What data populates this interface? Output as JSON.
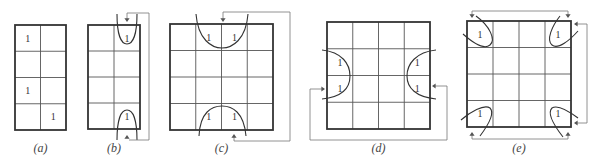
{
  "figure": {
    "width": 598,
    "height": 165,
    "cell_value": "1",
    "colors": {
      "grid": "#333333",
      "connector": "#777777",
      "text": "#333333"
    }
  },
  "maps": [
    {
      "id": "a",
      "caption": "(a)",
      "rows": 4,
      "cols": 2,
      "x": 15,
      "y": 25,
      "w": 51,
      "h": 105,
      "ones": [
        [
          0,
          0
        ],
        [
          2,
          0
        ],
        [
          3,
          1
        ]
      ],
      "loops": [],
      "connectors": []
    },
    {
      "id": "b",
      "caption": "(b)",
      "rows": 4,
      "cols": 2,
      "x": 88,
      "y": 25,
      "w": 52,
      "h": 104,
      "ones": [
        [
          0,
          1
        ],
        [
          3,
          1
        ]
      ],
      "loops": [
        "M 117 14 C 117 34, 121 44, 127 44 C 133 44, 137 34, 137 14",
        "M 117 140 C 117 120, 121 110, 127 110 C 133 110, 137 120, 137 140"
      ],
      "connectors": [
        {
          "path": "M 127 20 L 127 13 L 149 13 L 149 140 L 129 140",
          "arrows": [
            [
              127,
              22,
              "down"
            ],
            [
              127,
              135,
              "up"
            ]
          ]
        }
      ]
    },
    {
      "id": "c",
      "caption": "(c)",
      "rows": 4,
      "cols": 4,
      "x": 170,
      "y": 24,
      "w": 103,
      "h": 106,
      "ones": [
        [
          0,
          1
        ],
        [
          0,
          2
        ],
        [
          3,
          1
        ],
        [
          3,
          2
        ]
      ],
      "loops": [
        "M 196 14 C 198 40, 212 48, 222 48 C 232 48, 246 40, 248 14",
        "M 199 136 C 200 112, 212 106, 222 106 C 232 106, 244 112, 246 136"
      ],
      "connectors": [
        {
          "path": "M 223 20 L 223 12 L 290 12 L 290 141 L 234 141 L 234 136",
          "arrows": [
            [
              223,
              22,
              "down"
            ],
            [
              234,
              134,
              "up"
            ]
          ]
        }
      ]
    },
    {
      "id": "d",
      "caption": "(d)",
      "rows": 4,
      "cols": 4,
      "x": 327,
      "y": 22,
      "w": 103,
      "h": 107,
      "ones": [
        [
          1,
          0
        ],
        [
          2,
          0
        ],
        [
          1,
          3
        ],
        [
          2,
          3
        ]
      ],
      "loops": [
        "M 322 50 C 342 52, 350 64, 350 76 C 350 88, 342 97, 322 99",
        "M 436 50 C 416 52, 407 64, 407 76 C 407 88, 416 97, 436 99"
      ],
      "connectors": [
        {
          "path": "M 324 89 L 310 89 L 310 140 L 447 140 L 447 86 L 434 86",
          "arrows": [
            [
              325,
              89,
              "right"
            ],
            [
              432,
              86,
              "left"
            ]
          ]
        }
      ]
    },
    {
      "id": "e",
      "caption": "(e)",
      "rows": 4,
      "cols": 4,
      "x": 467,
      "y": 21,
      "w": 104,
      "h": 106,
      "ones": [
        [
          0,
          0
        ],
        [
          0,
          3
        ],
        [
          3,
          0
        ],
        [
          3,
          3
        ]
      ],
      "loops": [
        "M 476 16 C 490 26, 496 40, 490 45 C 484 50, 472 42, 463 34",
        "M 560 16 C 552 26, 546 40, 552 45 C 558 50, 570 40, 578 31",
        "M 461 120 C 470 112, 484 104, 490 108 C 496 114, 486 128, 480 136",
        "M 578 118 C 570 112, 558 104, 552 108 C 546 114, 556 128, 563 137"
      ],
      "connectors": [
        {
          "path": "M 472 17 L 472 11 L 568 11 L 568 17",
          "arrows": [
            [
              472,
              18,
              "down"
            ],
            [
              568,
              18,
              "down"
            ]
          ]
        },
        {
          "path": "M 575 24 L 587 24 L 587 123 L 575 123",
          "arrows": [
            [
              574,
              24,
              "left"
            ],
            [
              574,
              123,
              "left"
            ]
          ]
        },
        {
          "path": "M 472 133 L 472 139 L 568 139 L 568 133",
          "arrows": [
            [
              472,
              132,
              "up"
            ],
            [
              568,
              132,
              "up"
            ]
          ]
        }
      ]
    }
  ]
}
